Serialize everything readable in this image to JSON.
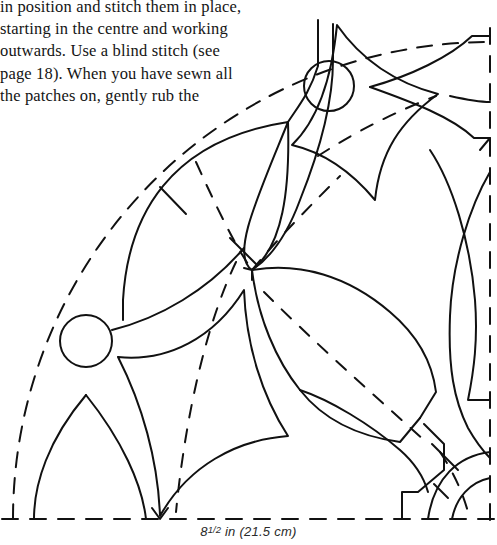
{
  "document": {
    "body_text_lines": [
      "in position and stitch them in place,",
      "starting in the centre and working",
      "outwards. Use a blind stitch (see",
      "page 18). When you have sewn all",
      "the patches on, gently rub the"
    ]
  },
  "caption": {
    "whole": "8",
    "fraction": "1/2",
    "rest": " in (21.5 cm)",
    "full_text": "8 1/2 in (21.5 cm)"
  },
  "diagram": {
    "name": "quilt-quarter-pattern-template",
    "line_color": "#111111",
    "background_color": "#ffffff",
    "stroke_width": 2.0,
    "dash_pattern": "14 11",
    "center": {
      "x": 490,
      "y": 519
    },
    "radius": 477,
    "elements": [
      {
        "name": "dashed-quarter-arc",
        "type": "arc",
        "style": "dashed"
      },
      {
        "name": "dashed-bottom-edge",
        "type": "line",
        "style": "dashed"
      },
      {
        "name": "dashed-right-edge",
        "type": "line",
        "style": "dashed"
      },
      {
        "name": "circle-top",
        "type": "circle",
        "cx": 329,
        "cy": 86,
        "r": 25
      },
      {
        "name": "circle-lower-left",
        "type": "circle",
        "cx": 86,
        "cy": 341,
        "r": 26
      },
      {
        "name": "leaf-patch-upper-left",
        "type": "path",
        "style": "solid"
      },
      {
        "name": "leaf-patch-right-point",
        "type": "path",
        "style": "solid"
      },
      {
        "name": "leaf-patch-center",
        "type": "path",
        "style": "solid"
      },
      {
        "name": "concave-diamond-upper-right",
        "type": "path",
        "style": "solid"
      },
      {
        "name": "concave-diamond-lower-left",
        "type": "path",
        "style": "solid"
      },
      {
        "name": "pointed-arch-bottom-left",
        "type": "path",
        "style": "solid"
      },
      {
        "name": "corner-arc-bottom-right",
        "type": "path",
        "style": "solid"
      }
    ]
  }
}
